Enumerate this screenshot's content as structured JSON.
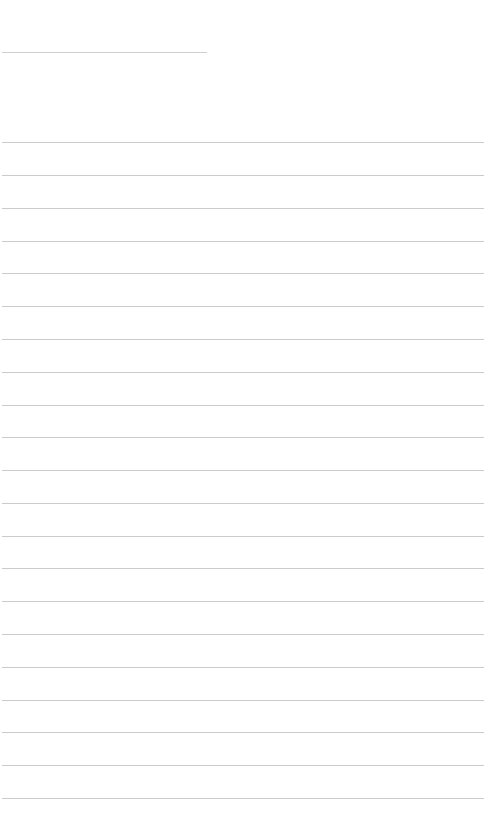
{
  "page": {
    "type": "ruled-note",
    "title": {
      "value": "",
      "placeholder": ""
    },
    "line_color": "#cbcbcb",
    "background": "#ffffff",
    "lines": [
      {
        "y": 142,
        "text": ""
      },
      {
        "y": 175,
        "text": ""
      },
      {
        "y": 208,
        "text": ""
      },
      {
        "y": 241,
        "text": ""
      },
      {
        "y": 273,
        "text": ""
      },
      {
        "y": 306,
        "text": ""
      },
      {
        "y": 339,
        "text": ""
      },
      {
        "y": 372,
        "text": ""
      },
      {
        "y": 405,
        "text": ""
      },
      {
        "y": 437,
        "text": ""
      },
      {
        "y": 470,
        "text": ""
      },
      {
        "y": 503,
        "text": ""
      },
      {
        "y": 536,
        "text": ""
      },
      {
        "y": 568,
        "text": ""
      },
      {
        "y": 601,
        "text": ""
      },
      {
        "y": 634,
        "text": ""
      },
      {
        "y": 667,
        "text": ""
      },
      {
        "y": 700,
        "text": ""
      },
      {
        "y": 732,
        "text": ""
      },
      {
        "y": 765,
        "text": ""
      },
      {
        "y": 798,
        "text": ""
      }
    ]
  }
}
